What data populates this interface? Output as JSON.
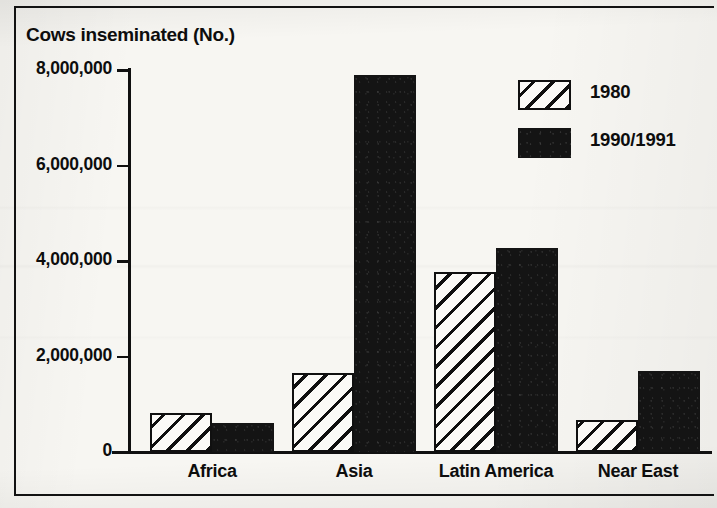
{
  "chart_data": {
    "type": "bar",
    "title": "Cows inseminated (No.)",
    "xlabel": "",
    "ylabel": "",
    "categories": [
      "Africa",
      "Asia",
      "Latin America",
      "Near East"
    ],
    "series": [
      {
        "name": "1980",
        "values": [
          820000,
          1650000,
          3770000,
          670000
        ],
        "pattern": "diagonal-hatch"
      },
      {
        "name": "1990/1991",
        "values": [
          610000,
          7900000,
          4270000,
          1700000
        ],
        "pattern": "solid-black"
      }
    ],
    "ylim": [
      0,
      8000000
    ],
    "ytick_values": [
      8000000,
      6000000,
      4000000,
      2000000,
      0
    ],
    "ytick_labels": [
      "8,000,000",
      "6,000,000",
      "4,000,000",
      "2,000,000",
      "0"
    ],
    "grid": false,
    "legend_position": "top-right",
    "colors": {
      "series_1980_fill": "#fbfaf7",
      "series_1980_line": "#101010",
      "series_1990_fill": "#141414",
      "axis": "#101010",
      "text": "#0d0d0d",
      "background": "#f7f6f2"
    }
  },
  "legend": {
    "entries": [
      {
        "label": "1980",
        "swatch": "hatch-swatch"
      },
      {
        "label": "1990/1991",
        "swatch": "solid-swatch"
      }
    ]
  }
}
